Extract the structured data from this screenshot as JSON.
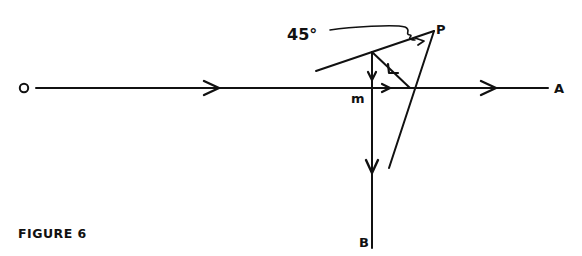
{
  "figure": {
    "caption": "FIGURE 6",
    "labels": {
      "origin": "O",
      "end_a": "A",
      "end_b": "B",
      "point_m": "m",
      "point_p": "P",
      "angle": "45°"
    },
    "colors": {
      "ink": "#111111",
      "background": "#ffffff"
    },
    "elements": [
      {
        "name": "ray-OA",
        "type": "line",
        "from": "O",
        "to": "A",
        "direction": "left-to-right"
      },
      {
        "name": "ray-mB",
        "type": "line",
        "from": "m",
        "to": "B",
        "direction": "downward"
      },
      {
        "name": "mirror",
        "type": "line",
        "description": "inclined line through P at 45°"
      },
      {
        "name": "line-P",
        "type": "line",
        "description": "line from P down across OA"
      },
      {
        "name": "reflected-ray",
        "type": "line",
        "description": "ray from OA intersection back up to mirror"
      }
    ]
  }
}
